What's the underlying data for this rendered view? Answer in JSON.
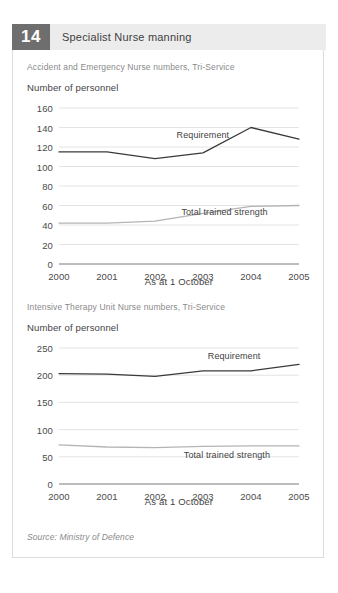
{
  "figure": {
    "number": "14",
    "title": "Specialist Nurse manning",
    "source": "Source: Ministry of Defence"
  },
  "colors": {
    "badge_bg": "#6e6e6e",
    "header_bg": "#ececec",
    "requirement_line": "#3a3a3a",
    "trained_line": "#b4b4b4",
    "gridline": "#e3e3e3",
    "axis": "#7a7a7a",
    "card_border": "#dcdcdc"
  },
  "chart_data": [
    {
      "type": "line",
      "title": "Accident and Emergency Nurse numbers, Tri-Service",
      "ylabel": "Number of personnel",
      "xlabel": "As at 1 October",
      "categories": [
        "2000",
        "2001",
        "2002",
        "2003",
        "2004",
        "2005"
      ],
      "x": [
        2000,
        2001,
        2002,
        2003,
        2004,
        2005
      ],
      "ylim": [
        0,
        160
      ],
      "yticks": [
        "160",
        "140",
        "120",
        "100",
        "80",
        "60",
        "40",
        "20",
        "0"
      ],
      "ytick_values": [
        160,
        140,
        120,
        100,
        80,
        60,
        40,
        20,
        0
      ],
      "grid": true,
      "legend": "inline-annotation",
      "series": [
        {
          "name": "Requirement",
          "values": [
            115,
            115,
            108,
            114,
            140,
            128
          ],
          "color": "#3a3a3a",
          "label_x": 2002.45,
          "label_y": 131
        },
        {
          "name": "Total trained strength",
          "values": [
            42,
            42,
            44,
            52,
            59,
            60
          ],
          "color": "#b4b4b4",
          "label_x": 2002.55,
          "label_y": 52
        }
      ]
    },
    {
      "type": "line",
      "title": "Intensive Therapy Unit Nurse numbers, Tri-Service",
      "ylabel": "Number of personnel",
      "xlabel": "As at 1 October",
      "categories": [
        "2000",
        "2001",
        "2002",
        "2003",
        "2004",
        "2005"
      ],
      "x": [
        2000,
        2001,
        2002,
        2003,
        2004,
        2005
      ],
      "ylim": [
        0,
        250
      ],
      "yticks": [
        "250",
        "200",
        "150",
        "100",
        "50",
        "0"
      ],
      "ytick_values": [
        250,
        200,
        150,
        100,
        50,
        0
      ],
      "grid": true,
      "legend": "inline-annotation",
      "series": [
        {
          "name": "Requirement",
          "values": [
            203,
            202,
            198,
            208,
            208,
            220
          ],
          "color": "#3a3a3a",
          "label_x": 2003.1,
          "label_y": 233
        },
        {
          "name": "Total trained strength",
          "values": [
            72,
            68,
            67,
            69,
            70,
            70
          ],
          "color": "#b4b4b4",
          "label_x": 2002.6,
          "label_y": 52
        }
      ]
    }
  ]
}
